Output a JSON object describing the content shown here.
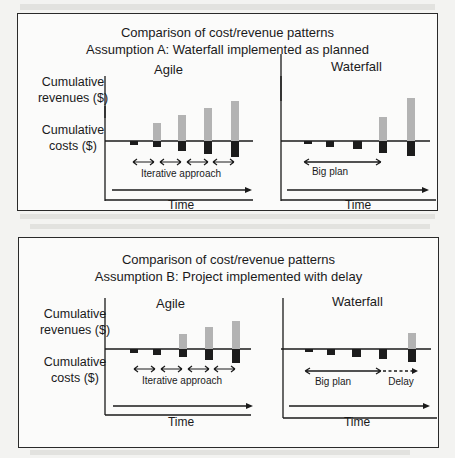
{
  "figures": [
    {
      "title_line1": "Comparison of  cost/revenue patterns",
      "title_line2": "Assumption A:  Waterfall implemented as planned",
      "y_label_revenues": "Cumulative revenues ($)",
      "y_label_costs": "Cumulative costs ($)",
      "agile": {
        "title": "Agile",
        "annotation": "Iterative approach",
        "x_label": "Time",
        "bars": [
          {
            "revenue": 0,
            "cost": 2
          },
          {
            "revenue": 14,
            "cost": 6
          },
          {
            "revenue": 25,
            "cost": 10
          },
          {
            "revenue": 32,
            "cost": 14
          },
          {
            "revenue": 40,
            "cost": 18
          }
        ]
      },
      "waterfall": {
        "title": "Waterfall",
        "annotation": "Big plan",
        "x_label": "Time",
        "bars": [
          {
            "revenue": 0,
            "cost": 3
          },
          {
            "revenue": 0,
            "cost": 7
          },
          {
            "revenue": 0,
            "cost": 9
          },
          {
            "revenue": 24,
            "cost": 13
          },
          {
            "revenue": 42,
            "cost": 16
          }
        ]
      }
    },
    {
      "title_line1": "Comparison of  cost/revenue patterns",
      "title_line2": "Assumption B:  Project implemented with delay",
      "y_label_revenues": "Cumulative revenues ($)",
      "y_label_costs": "Cumulative costs ($)",
      "agile": {
        "title": "Agile",
        "annotation": "Iterative approach",
        "x_label": "Time",
        "bars": [
          {
            "revenue": 0,
            "cost": 3
          },
          {
            "revenue": 0,
            "cost": 6
          },
          {
            "revenue": 16,
            "cost": 10
          },
          {
            "revenue": 24,
            "cost": 14
          },
          {
            "revenue": 32,
            "cost": 18
          }
        ]
      },
      "waterfall": {
        "title": "Waterfall",
        "annotation": "Big plan",
        "annotation_delay": "Delay",
        "x_label": "Time",
        "bars": [
          {
            "revenue": 0,
            "cost": 3
          },
          {
            "revenue": 0,
            "cost": 6
          },
          {
            "revenue": 0,
            "cost": 10
          },
          {
            "revenue": 0,
            "cost": 13
          },
          {
            "revenue": 16,
            "cost": 16
          }
        ]
      }
    }
  ],
  "colors": {
    "revenue_bar": "#b3b3b3",
    "cost_bar": "#1c1c1c",
    "line": "#1a1a1a"
  }
}
